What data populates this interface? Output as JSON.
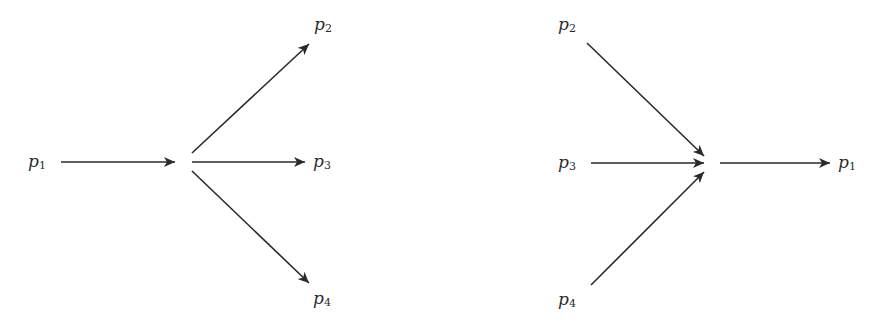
{
  "diagrams": [
    {
      "name": "split",
      "labels": {
        "p1": {
          "base": "p",
          "sub": "1"
        },
        "p2": {
          "base": "p",
          "sub": "2"
        },
        "p3": {
          "base": "p",
          "sub": "3"
        },
        "p4": {
          "base": "p",
          "sub": "4"
        }
      },
      "description": "p1 flows into a node that splits into p2, p3, p4"
    },
    {
      "name": "merge",
      "labels": {
        "p1": {
          "base": "p",
          "sub": "1"
        },
        "p2": {
          "base": "p",
          "sub": "2"
        },
        "p3": {
          "base": "p",
          "sub": "3"
        },
        "p4": {
          "base": "p",
          "sub": "4"
        }
      },
      "description": "p2, p3, p4 merge into a node that flows to p1"
    }
  ],
  "colors": {
    "stroke": "#2a2a2a",
    "background": "#ffffff"
  }
}
